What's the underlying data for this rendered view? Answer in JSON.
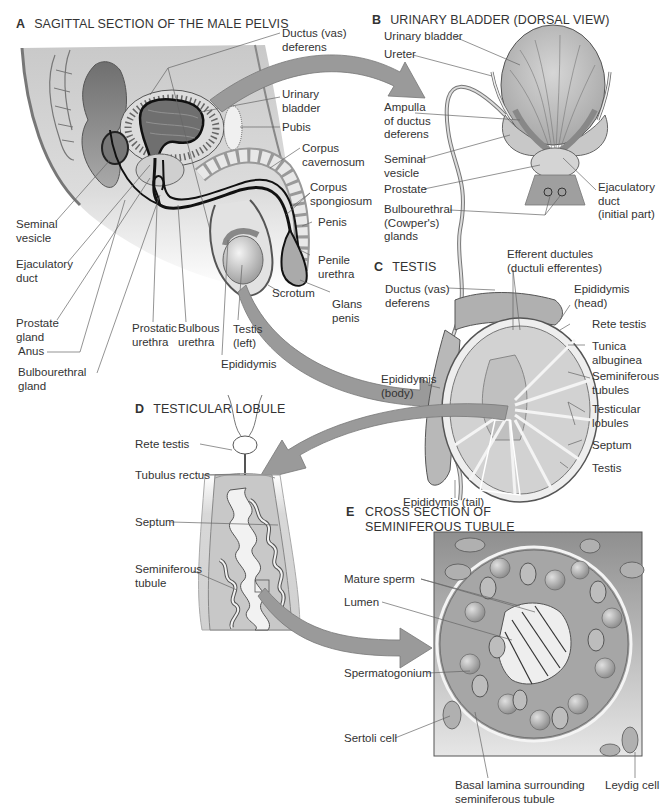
{
  "colors": {
    "tissue_dark": "#8a8a8a",
    "tissue_mid": "#b5b5b5",
    "tissue_light": "#d8d8d8",
    "arrow": "#9a9a9a",
    "line": "#555555",
    "background": "#ffffff"
  },
  "panels": {
    "A": {
      "letter": "A",
      "title": "SAGITTAL SECTION OF THE MALE PELVIS",
      "labels": {
        "ductus_deferens": "Ductus (vas)\ndeferens",
        "urinary_bladder": "Urinary\nbladder",
        "pubis": "Pubis",
        "corpus_cavernosum": "Corpus\ncavernosum",
        "corpus_spongiosum": "Corpus\nspongiosum",
        "penis": "Penis",
        "penile_urethra": "Penile\nurethra",
        "glans_penis": "Glans\npenis",
        "scrotum": "Scrotum",
        "seminal_vesicle": "Seminal\nvesicle",
        "ejaculatory_duct": "Ejaculatory\nduct",
        "prostate_gland": "Prostate\ngland",
        "anus": "Anus",
        "bulbourethral_gland": "Bulbourethral\ngland",
        "prostatic_urethra": "Prostatic\nurethra",
        "bulbous_urethra": "Bulbous\nurethra",
        "testis_left": "Testis\n(left)",
        "epididymis": "Epididymis"
      }
    },
    "B": {
      "letter": "B",
      "title": "URINARY BLADDER (DORSAL VIEW)",
      "labels": {
        "urinary_bladder": "Urinary bladder",
        "ureter": "Ureter",
        "ampulla": "Ampulla\nof ductus\ndeferens",
        "seminal_vesicle": "Seminal\nvesicle",
        "prostate": "Prostate",
        "bulbourethral": "Bulbourethral\n(Cowper's)\nglands",
        "ejaculatory_duct": "Ejaculatory\nduct\n(initial part)"
      }
    },
    "C": {
      "letter": "C",
      "title": "TESTIS",
      "labels": {
        "efferent_ductules": "Efferent ductules\n(ductuli efferentes)",
        "ductus_deferens": "Ductus (vas)\ndeferens",
        "epididymis_head": "Epididymis\n(head)",
        "rete_testis": "Rete testis",
        "tunica_albuginea": "Tunica\nalbuginea",
        "seminiferous_tubules": "Seminiferous\ntubules",
        "testicular_lobules": "Testicular\nlobules",
        "septum": "Septum",
        "testis": "Testis",
        "epididymis_body": "Epididymis\n(body)",
        "epididymis_tail": "Epididymis (tail)"
      }
    },
    "D": {
      "letter": "D",
      "title": "TESTICULAR LOBULE",
      "labels": {
        "rete_testis": "Rete testis",
        "tubulus_rectus": "Tubulus rectus",
        "septum": "Septum",
        "seminiferous_tubule": "Seminiferous\ntubule"
      }
    },
    "E": {
      "letter": "E",
      "title": "CROSS SECTION OF\nSEMINIFEROUS TUBULE",
      "labels": {
        "mature_sperm": "Mature sperm",
        "lumen": "Lumen",
        "spermatogonium": "Spermatogonium",
        "sertoli_cell": "Sertoli cell",
        "basal_lamina": "Basal lamina surrounding\nseminiferous tubule",
        "leydig_cell": "Leydig cell"
      }
    }
  }
}
